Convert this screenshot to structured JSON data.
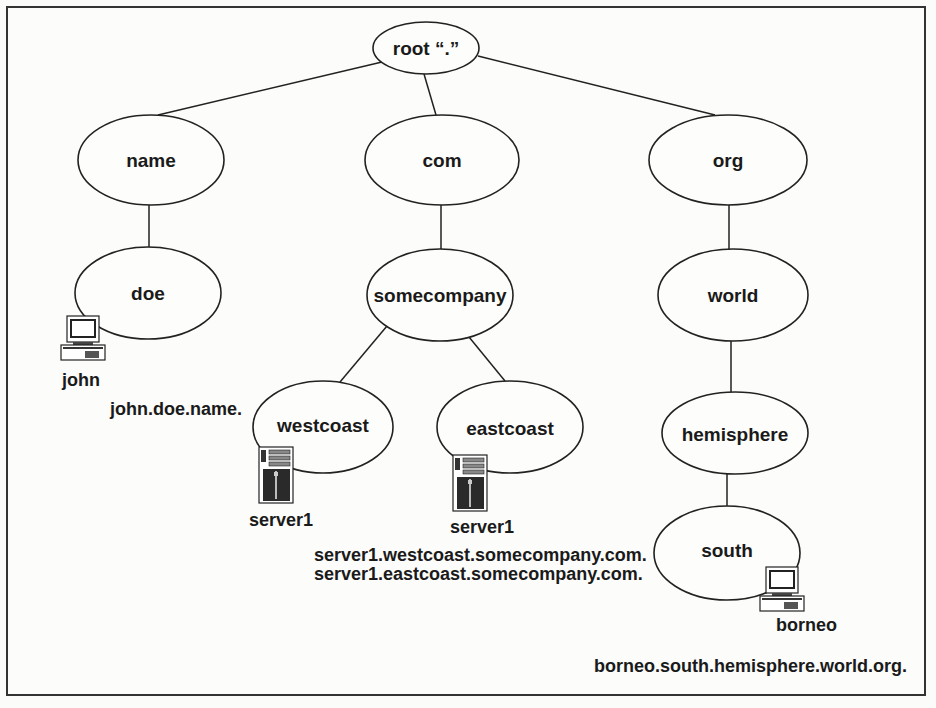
{
  "diagram": {
    "type": "tree",
    "nodes": [
      {
        "id": "root",
        "label": "root “.”",
        "cx": 426,
        "cy": 48,
        "rx": 53,
        "ry": 26
      },
      {
        "id": "name",
        "label": "name",
        "cx": 151,
        "cy": 160,
        "rx": 73,
        "ry": 45
      },
      {
        "id": "com",
        "label": "com",
        "cx": 442,
        "cy": 160,
        "rx": 77,
        "ry": 45
      },
      {
        "id": "org",
        "label": "org",
        "cx": 728,
        "cy": 160,
        "rx": 79,
        "ry": 45
      },
      {
        "id": "doe",
        "label": "doe",
        "cx": 148,
        "cy": 293,
        "rx": 73,
        "ry": 46
      },
      {
        "id": "somecompany",
        "label": "somecompany",
        "cx": 440,
        "cy": 295,
        "rx": 73,
        "ry": 46
      },
      {
        "id": "world",
        "label": "world",
        "cx": 733,
        "cy": 295,
        "rx": 75,
        "ry": 46
      },
      {
        "id": "westcoast",
        "label": "westcoast",
        "cx": 323,
        "cy": 427,
        "rx": 70,
        "ry": 46
      },
      {
        "id": "eastcoast",
        "label": "eastcoast",
        "cx": 510,
        "cy": 427,
        "rx": 73,
        "ry": 46
      },
      {
        "id": "hemisphere",
        "label": "hemisphere",
        "cx": 735,
        "cy": 433,
        "rx": 73,
        "ry": 41
      },
      {
        "id": "south",
        "label": "south",
        "cx": 727,
        "cy": 553,
        "rx": 73,
        "ry": 47
      }
    ],
    "edges": [
      [
        "root",
        "name"
      ],
      [
        "root",
        "com"
      ],
      [
        "root",
        "org"
      ],
      [
        "name",
        "doe"
      ],
      [
        "com",
        "somecompany"
      ],
      [
        "org",
        "world"
      ],
      [
        "somecompany",
        "westcoast"
      ],
      [
        "somecompany",
        "eastcoast"
      ],
      [
        "world",
        "hemisphere"
      ],
      [
        "hemisphere",
        "south"
      ]
    ],
    "hosts": [
      {
        "id": "john",
        "kind": "desktop-computer",
        "label": "john",
        "parent": "doe",
        "fqdn": "john.doe.name."
      },
      {
        "id": "server1-west",
        "kind": "server-tower",
        "label": "server1",
        "parent": "westcoast",
        "fqdn": "server1.westcoast.somecompany.com."
      },
      {
        "id": "server1-east",
        "kind": "server-tower",
        "label": "server1",
        "parent": "eastcoast",
        "fqdn": "server1.eastcoast.somecompany.com."
      },
      {
        "id": "borneo",
        "kind": "desktop-computer",
        "label": "borneo",
        "parent": "south",
        "fqdn": "borneo.south.hemisphere.world.org."
      }
    ]
  },
  "labels": {
    "root": "root “.”",
    "name": "name",
    "com": "com",
    "org": "org",
    "doe": "doe",
    "somecompany": "somecompany",
    "world": "world",
    "westcoast": "westcoast",
    "eastcoast": "eastcoast",
    "hemisphere": "hemisphere",
    "south": "south",
    "host_john": "john",
    "host_server1_west": "server1",
    "host_server1_east": "server1",
    "host_borneo": "borneo",
    "fqdn_john": "john.doe.name.",
    "fqdn_server1_west": "server1.westcoast.somecompany.com.",
    "fqdn_server1_east": "server1.eastcoast.somecompany.com.",
    "fqdn_borneo": "borneo.south.hemisphere.world.org."
  },
  "colors": {
    "stroke": "#222222",
    "background": "#fcfcfa",
    "text": "#1a1a1a"
  }
}
